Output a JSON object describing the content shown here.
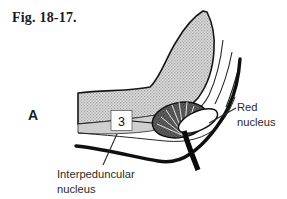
{
  "figure": {
    "caption": "Fig. 18-17.",
    "panel_letter": "A"
  },
  "diagram": {
    "callout_number": "3",
    "labels": {
      "red_nucleus": {
        "line1": "Red",
        "line2": "nucleus"
      },
      "interpeduncular_nucleus": {
        "line1": "Interpeduncular",
        "line2": "nucleus"
      }
    },
    "colors": {
      "ink": "#1c1c1c",
      "label_text": "#2b2b2b",
      "band_base": "#dcdcdc",
      "band_texture_dots": "#9f9f9f",
      "ventral_strip_gray": "#cfcfcf",
      "dark_nucleus_base": "#6b6b6b",
      "dark_nucleus_dots": "#2e2e2e",
      "red_nucleus_fill": "#ffffff",
      "background": "#ffffff"
    }
  }
}
